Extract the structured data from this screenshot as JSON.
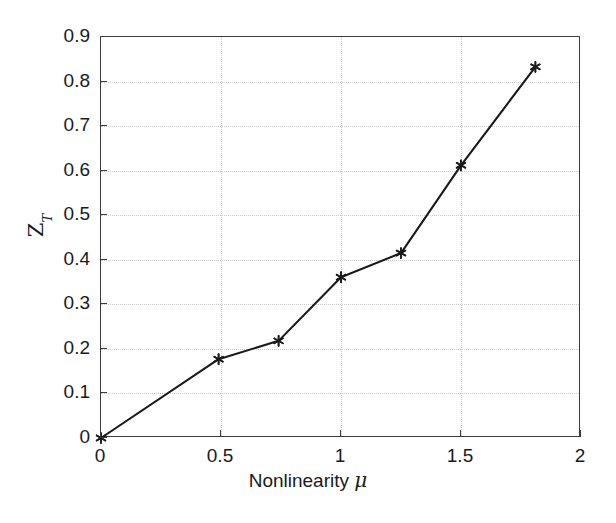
{
  "chart_data": {
    "type": "line",
    "title": "",
    "xlabel": "Nonlinearity μ",
    "xlabel_text": "Nonlinearity ",
    "xlabel_symbol": "μ",
    "ylabel": "Z_T",
    "ylabel_base": "Z",
    "ylabel_sub": "T",
    "xlim": [
      0,
      2
    ],
    "ylim": [
      0,
      0.9
    ],
    "grid": true,
    "legend": null,
    "x": [
      0,
      0.49,
      0.74,
      1.0,
      1.25,
      1.5,
      1.81
    ],
    "values": [
      0,
      0.177,
      0.218,
      0.361,
      0.415,
      0.612,
      0.833
    ],
    "series": [
      {
        "name": "ZT vs nonlinearity",
        "marker": "asterisk",
        "line_color": "#1a1a1a",
        "points": [
          {
            "x": 0,
            "y": 0
          },
          {
            "x": 0.49,
            "y": 0.177
          },
          {
            "x": 0.74,
            "y": 0.218
          },
          {
            "x": 1.0,
            "y": 0.361
          },
          {
            "x": 1.25,
            "y": 0.415
          },
          {
            "x": 1.5,
            "y": 0.612
          },
          {
            "x": 1.81,
            "y": 0.833
          }
        ]
      }
    ],
    "xticks": [
      0,
      0.5,
      1,
      1.5,
      2
    ],
    "xticklabels": [
      "0",
      "0.5",
      "1",
      "1.5",
      "2"
    ],
    "yticks": [
      0,
      0.1,
      0.2,
      0.3,
      0.4,
      0.5,
      0.6,
      0.7,
      0.8,
      0.9
    ],
    "yticklabels": [
      "0",
      "0.1",
      "0.2",
      "0.3",
      "0.4",
      "0.5",
      "0.6",
      "0.7",
      "0.8",
      "0.9"
    ],
    "colors": {
      "axis": "#3a3a3a",
      "grid": "#c9c9c9",
      "line": "#1a1a1a",
      "marker": "#1a1a1a",
      "background": "#ffffff"
    }
  }
}
